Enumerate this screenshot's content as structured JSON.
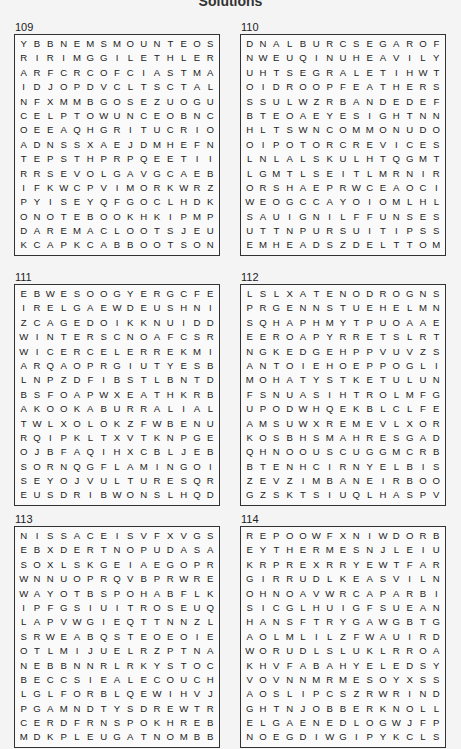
{
  "page": {
    "title": "Solutions"
  },
  "puzzles": [
    {
      "number": "109",
      "rows": [
        "YBBNEMSMOUNTEOS",
        "RIRIMGGILETHLER",
        "ARFCRCOFCIASTMA",
        "IDJOPDVCLTSCTAL",
        "NFXMMBGOSEZUOGU",
        "CELPTOWUNCEOBNC",
        "OEEAQHGRITUCRIO",
        "ADNSSXAEJDMHEFN",
        "TEPSTHPRPQEETII",
        "RRSEVOLGAVGCAEB",
        "IFKWCPVIMORKWRZ",
        "PYISEYQFGOCLHDK",
        "ONOTEBOOKHKIPMP",
        "DAREMACLOOTSJEU",
        "KCAPKCABBOOTSON"
      ]
    },
    {
      "number": "110",
      "rows": [
        "DNALBURCSEGAROF",
        "NWEUQINUHEAVILY",
        "UHTSEGRALETIHWT",
        "OIDROOPFEATHERS",
        "SSULWZRBANDEDEF",
        "BTEOAEYESIGHTNN",
        "HLTSWNCOMMONUDO",
        "OIPOTORCREVICES",
        "LNLALSKULHTQGMT",
        "LGMTLSEITLMRNIR",
        "ORSHAEPRWCEAOCI",
        "WEOGCCAYOIOMLHL",
        "SAUIGNILFFUNSES",
        "UTTNPURSUITIPSS",
        "EMHEADSZDELTTOM"
      ]
    },
    {
      "number": "111",
      "rows": [
        "EBWESOOGYERGCFE",
        "IRELGAEWDEUSHNI",
        "ZCAGEDOIKKNUIDD",
        "WINTERSCNOAFCSR",
        "WICERCELERREKMI",
        "ARQAOPRGIUTYESB",
        "LNPZDFIBSTLBNTD",
        "BSFOAPWXEATHKRB",
        "AKOOKABURRALIAL",
        "TWLXOLOKZFWBENU",
        "RQIPKLTXVTKNPGE",
        "OJBFAQIHXCBLJEB",
        "SORNQGFLAMINGOI",
        "SEYOJVULTURESQR",
        "EUSDRIBWONSLHQD"
      ]
    },
    {
      "number": "112",
      "rows": [
        "LSLXATENODROGNS",
        "PRGENNSTUEHELMN",
        "SQHAPHMYTPUOAAE",
        "EEROAPYRRETSLRT",
        "NGKEDGEHPPVUVZS",
        "ANTOIEHOEPPOGLI",
        "MOHATYSTKETULUN",
        "FSNUASIHTROLMFG",
        "UPODWHQEKBLCLFE",
        "AMSUWXREMEVLXOR",
        "KOSBHSMAHRESGAD",
        "QHNOOUSCUGGMCRB",
        "BTENHCIRNYELBIS",
        "ZEVZIMBANEIRBOO",
        "GZSKTSIUQLHASPV"
      ]
    },
    {
      "number": "113",
      "rows": [
        "NISSACEISVFXVGS",
        "EBXDERTNOPUDASA",
        "SOXLSKGEIAEGOPR",
        "WNNUOPRQVBPRWRE",
        "WAYOTBSPOHABFLK",
        "IPFGSIUITROSEUQ",
        "LAPVWGIEQTTNNZL",
        "SRWEABQSTEOEOIE",
        "OTLMIJUELRZPTNA",
        "NEBBNNRLRKYSTOC",
        "BECCSIEALECOUCH",
        "LGLFORBLQEWIHVJ",
        "PGAMNDTYSDREWTR",
        "CERDFRNSPOKHREB",
        "MDKPLEUGATNOMBB"
      ]
    },
    {
      "number": "114",
      "rows": [
        "REPOOWFXNIWDORB",
        "EYTHERMESNJLEIU",
        "KRPREXRRYEWTFAR",
        "GIRRUDLKEASVILN",
        "OHNOAVWRCAPAR BI",
        "SICGLHUIGFSUEAN",
        "HANSFTRYGAWGBTG",
        "AOLMLILZFWAUIRD",
        "WORUDLSLUKLRROA",
        "KHVFABAHYELEDSY",
        "VOVNNMRMESOYXSS",
        "AOSLIPCSZRWRIND",
        "GHTNJOBBERKNOLL",
        "ELGAENEDLOGWJFP",
        "NOEGDIWGIPYKCLS"
      ]
    }
  ]
}
